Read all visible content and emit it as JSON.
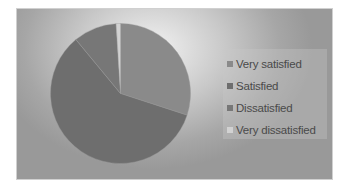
{
  "chart_data": {
    "type": "pie",
    "title": "",
    "categories": [
      "Very satisfied",
      "Satisfied",
      "Dissatisfied",
      "Very dissatisfied"
    ],
    "values": [
      30,
      59,
      10,
      1
    ],
    "colors": [
      "#8a8a8a",
      "#6e6e6e",
      "#777777",
      "#d2d2d2"
    ],
    "start_angle_deg": 0,
    "direction": "clockwise",
    "legend": {
      "position": "right",
      "entries": [
        "Very satisfied",
        "Satisfied",
        "Dissatisfied",
        "Very dissatisfied"
      ]
    }
  },
  "legend": {
    "items": [
      {
        "label": "Very satisfied",
        "color": "#8a8a8a"
      },
      {
        "label": "Satisfied",
        "color": "#6e6e6e"
      },
      {
        "label": "Dissatisfied",
        "color": "#777777"
      },
      {
        "label": "Very dissatisfied",
        "color": "#d2d2d2"
      }
    ]
  }
}
